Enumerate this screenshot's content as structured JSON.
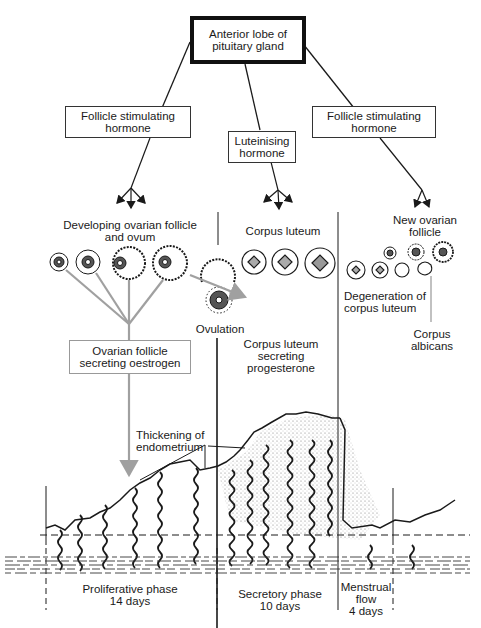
{
  "nodes": {
    "pituitary": {
      "line1": "Anterior lobe of",
      "line2": "pituitary gland"
    },
    "fsh_left": {
      "line1": "Follicle stimulating",
      "line2": "hormone"
    },
    "lh": {
      "line1": "Luteinising",
      "line2": "hormone"
    },
    "fsh_right": {
      "line1": "Follicle stimulating",
      "line2": "hormone"
    },
    "oestrogen": {
      "line1": "Ovarian follicle",
      "line2": "secreting oestrogen"
    }
  },
  "labels": {
    "developing_follicle": {
      "line1": "Developing ovarian follicle",
      "line2": "and ovum"
    },
    "corpus_luteum": "Corpus luteum",
    "new_follicle": {
      "line1": "New ovarian",
      "line2": "follicle"
    },
    "ovulation": "Ovulation",
    "degeneration": {
      "line1": "Degeneration of",
      "line2": "corpus luteum"
    },
    "corpus_albicans": {
      "line1": "Corpus",
      "line2": "albicans"
    },
    "cl_progesterone": {
      "line1": "Corpus luteum",
      "line2": "secreting",
      "line3": "progesterone"
    },
    "thickening": {
      "line1": "Thickening of",
      "line2": "endometrium"
    }
  },
  "phases": [
    {
      "name": "Proliferative phase",
      "duration": "14 days"
    },
    {
      "name": "Secretory phase",
      "duration": "10 days"
    },
    {
      "name": "Menstrual",
      "name2": "flow",
      "duration": "4 days"
    }
  ],
  "colors": {
    "line": "#1a1a1a",
    "grey_line": "#a0a0a0",
    "stipple": "#8a8a8a"
  }
}
